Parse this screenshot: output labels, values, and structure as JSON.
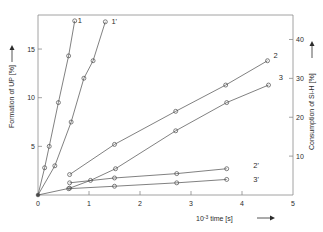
{
  "chart_data": {
    "type": "line",
    "title": "",
    "xlabel": "10⁻³ time [s]",
    "ylabel": "Formation of UP [%]",
    "y2label": "Consumption of Si-H [%]",
    "xlim": [
      0,
      5
    ],
    "ylim": [
      0,
      18.5
    ],
    "y2lim": [
      0,
      46.3
    ],
    "xticks": [
      0,
      1,
      2,
      3,
      4,
      5
    ],
    "xticklabels": [
      "0",
      "1",
      "2",
      "3",
      "4",
      "5"
    ],
    "yticks": [
      5,
      10,
      15
    ],
    "yticklabels": [
      "5",
      "10",
      "15"
    ],
    "y2ticks": [
      10,
      20,
      30,
      40
    ],
    "y2ticklabels": [
      "10",
      "20",
      "30",
      "40"
    ],
    "grid": false,
    "legend": "inline-curve-labels",
    "marker": "open-circle",
    "line_color": "#4a4a4a",
    "axis_color": "#8a8a8a",
    "series": [
      {
        "name": "1",
        "label": "1",
        "axis": "left",
        "label_x": 0.78,
        "label_y": 17.9,
        "points": [
          {
            "x": 0.0,
            "y": 0.0
          },
          {
            "x": 0.13,
            "y": 2.8
          },
          {
            "x": 0.22,
            "y": 5.0
          },
          {
            "x": 0.4,
            "y": 9.5
          },
          {
            "x": 0.6,
            "y": 14.3
          },
          {
            "x": 0.72,
            "y": 17.9
          }
        ]
      },
      {
        "name": "1'",
        "label": "1'",
        "axis": "left",
        "label_x": 1.44,
        "label_y": 17.8,
        "points": [
          {
            "x": 0.0,
            "y": 0.0
          },
          {
            "x": 0.33,
            "y": 3.0
          },
          {
            "x": 0.65,
            "y": 7.5
          },
          {
            "x": 0.9,
            "y": 12.0
          },
          {
            "x": 1.08,
            "y": 13.8
          },
          {
            "x": 1.32,
            "y": 17.8
          }
        ]
      },
      {
        "name": "2",
        "label": "2",
        "axis": "left",
        "label_x": 4.62,
        "label_y": 14.3,
        "points": [
          {
            "x": 0.62,
            "y": 2.1
          },
          {
            "x": 1.5,
            "y": 5.2
          },
          {
            "x": 2.7,
            "y": 8.6
          },
          {
            "x": 3.68,
            "y": 11.3
          },
          {
            "x": 4.5,
            "y": 13.8
          }
        ]
      },
      {
        "name": "3",
        "label": "3",
        "axis": "left",
        "label_x": 4.72,
        "label_y": 12.1,
        "points": [
          {
            "x": 0.0,
            "y": 0.0
          },
          {
            "x": 0.62,
            "y": 0.7
          },
          {
            "x": 1.03,
            "y": 1.5
          },
          {
            "x": 1.52,
            "y": 2.7
          },
          {
            "x": 2.7,
            "y": 6.6
          },
          {
            "x": 3.7,
            "y": 9.5
          },
          {
            "x": 4.52,
            "y": 11.3
          }
        ]
      },
      {
        "name": "2'",
        "label": "2'",
        "axis": "left",
        "label_x": 4.22,
        "label_y": 3.0,
        "points": [
          {
            "x": 0.62,
            "y": 1.25
          },
          {
            "x": 1.5,
            "y": 1.75
          },
          {
            "x": 2.72,
            "y": 2.2
          },
          {
            "x": 3.7,
            "y": 2.7
          }
        ]
      },
      {
        "name": "3'",
        "label": "3'",
        "axis": "left",
        "label_x": 4.22,
        "label_y": 1.6,
        "points": [
          {
            "x": 0.6,
            "y": 0.65
          },
          {
            "x": 1.5,
            "y": 0.9
          },
          {
            "x": 2.72,
            "y": 1.25
          },
          {
            "x": 3.7,
            "y": 1.6
          }
        ]
      }
    ]
  }
}
